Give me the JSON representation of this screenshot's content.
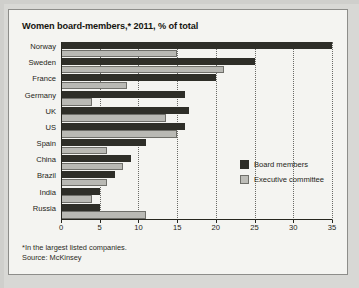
{
  "chart_data": {
    "type": "bar",
    "orientation": "horizontal",
    "title": "Women board-members,* 2011, % of total",
    "xlabel": "",
    "ylabel": "",
    "xlim": [
      0,
      35
    ],
    "xticks": [
      0,
      5,
      10,
      15,
      20,
      25,
      30,
      35
    ],
    "grid": "vertical-dotted",
    "legend_position": "inside-right",
    "categories": [
      "Norway",
      "Sweden",
      "France",
      "Germany",
      "UK",
      "US",
      "Spain",
      "China",
      "Brazil",
      "India",
      "Russia"
    ],
    "series": [
      {
        "name": "Board members",
        "color": "#2e2e28",
        "values": [
          35,
          25,
          20,
          16,
          16.5,
          16,
          11,
          9,
          7,
          5,
          5
        ]
      },
      {
        "name": "Executive committee",
        "color": "#bdbdb8",
        "values": [
          15,
          21,
          8.5,
          4,
          13.5,
          15,
          6,
          8,
          6,
          4,
          11
        ]
      }
    ],
    "footnote": "*In the largest listed companies.",
    "source": "Source: McKinsey"
  },
  "footer": {
    "footnote": "*In the largest listed companies.",
    "source": "Source: McKinsey"
  }
}
